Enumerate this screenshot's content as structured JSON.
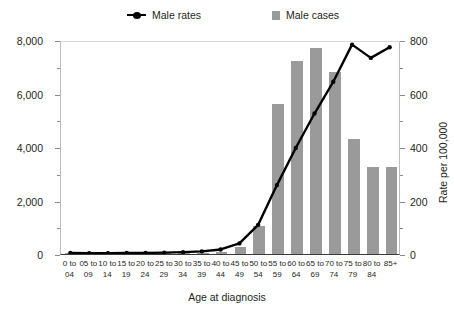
{
  "legend": {
    "items": [
      {
        "label": "Male rates",
        "marker": "line-marker-icon",
        "color": "#000000"
      },
      {
        "label": "Male cases",
        "marker": "square-swatch-icon",
        "color": "#9a9a9a"
      }
    ]
  },
  "axes": {
    "y_left_title": "Average number of cases per year",
    "y_right_title": "Rate per 100,000",
    "x_title": "Age at diagnosis",
    "y_left_ticks": [
      "0",
      "2,000",
      "4,000",
      "6,000",
      "8,000"
    ],
    "y_right_ticks": [
      "0",
      "200",
      "400",
      "600",
      "800"
    ]
  },
  "chart_data": {
    "type": "bar",
    "title": "",
    "xlabel": "Age at diagnosis",
    "ylabel": "Average number of cases per year",
    "y2label": "Rate per 100,000",
    "ylim": [
      0,
      8000
    ],
    "y2lim": [
      0,
      800
    ],
    "grid": false,
    "legend_position": "top",
    "categories": [
      "0 to 04",
      "05 to 09",
      "10 to 14",
      "15 to 19",
      "20 to 24",
      "25 to 29",
      "30 to 34",
      "35 to 39",
      "40 to 44",
      "45 to 49",
      "50 to 54",
      "55 to 59",
      "60 to 64",
      "65 to 69",
      "70 to 74",
      "75 to 79",
      "80 to 84",
      "85+"
    ],
    "category_lines": [
      [
        "0 to",
        "04"
      ],
      [
        "05 to",
        "09"
      ],
      [
        "10 to",
        "14"
      ],
      [
        "15 to",
        "19"
      ],
      [
        "20 to",
        "24"
      ],
      [
        "25 to",
        "29"
      ],
      [
        "30 to",
        "34"
      ],
      [
        "35 to",
        "39"
      ],
      [
        "40 to",
        "44"
      ],
      [
        "45 to",
        "49"
      ],
      [
        "50 to",
        "54"
      ],
      [
        "55 to",
        "59"
      ],
      [
        "60 to",
        "64"
      ],
      [
        "65 to",
        "69"
      ],
      [
        "70 to",
        "74"
      ],
      [
        "75 to",
        "79"
      ],
      [
        "80 to",
        "84"
      ],
      [
        "85+",
        ""
      ]
    ],
    "series": [
      {
        "name": "Male cases",
        "axis": "left",
        "type": "bar",
        "color": "#9a9a9a",
        "values": [
          20,
          20,
          20,
          25,
          25,
          30,
          40,
          55,
          90,
          250,
          1050,
          5600,
          7200,
          7700,
          6800,
          4300,
          3250,
          3250
        ]
      },
      {
        "name": "Male rates",
        "axis": "right",
        "type": "line",
        "color": "#000000",
        "values": [
          4,
          3,
          3,
          4,
          4,
          5,
          7,
          10,
          17,
          40,
          110,
          260,
          400,
          530,
          650,
          790,
          740,
          780
        ]
      }
    ]
  }
}
